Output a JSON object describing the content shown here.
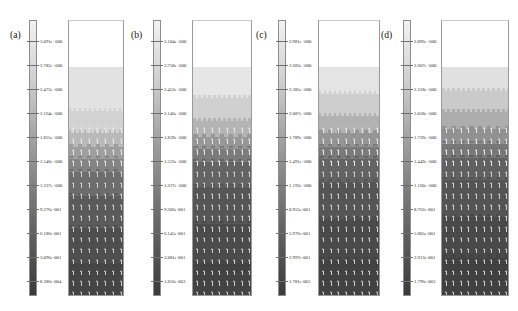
{
  "figure": {
    "type": "contour-vector-plots",
    "panel_count": 4,
    "colorbar_orientation": "vertical",
    "colorbar_colormap": "grayscale",
    "colorbar_top_color": "#f2f2f2",
    "colorbar_bottom_color": "#3a3a3a"
  },
  "chart_data": {
    "type": "heatmap",
    "title": "",
    "xlabel": "",
    "ylabel": "",
    "grid": false,
    "legend_position": "left-of-each-panel",
    "panels": [
      {
        "label": "(a)",
        "colorbar_ticks": [
          "3.091e+000",
          "2.782e+000",
          "2.473e+000",
          "2.164e+000",
          "1.855e+000",
          "1.546e+000",
          "1.237e+000",
          "9.276e-001",
          "6.186e-001",
          "3.096e-001",
          "8.386e-004"
        ],
        "vmax": 3.091,
        "vmin": 0.0008386,
        "surface_fraction": 0.168,
        "bands": [
          {
            "value": 2.78,
            "color": "#e2e2e2",
            "top": 0.0,
            "bottom": 0.19
          },
          {
            "value": 2.47,
            "color": "#d2d2d2",
            "top": 0.19,
            "bottom": 0.285
          },
          {
            "value": 2.16,
            "color": "#b9b9b9",
            "top": 0.285,
            "bottom": 0.345
          },
          {
            "value": 1.86,
            "color": "#9e9e9e",
            "top": 0.345,
            "bottom": 0.4
          },
          {
            "value": 1.55,
            "color": "#848484",
            "top": 0.4,
            "bottom": 0.455
          },
          {
            "value": 1.24,
            "color": "#6d6d6d",
            "top": 0.455,
            "bottom": 0.56
          },
          {
            "value": 0.93,
            "color": "#5b5b5b",
            "top": 0.56,
            "bottom": 0.7
          },
          {
            "value": 0.62,
            "color": "#4e4e4e",
            "top": 0.7,
            "bottom": 0.85
          },
          {
            "value": 0.31,
            "color": "#454545",
            "top": 0.85,
            "bottom": 1.0
          }
        ]
      },
      {
        "label": "(b)",
        "colorbar_ticks": [
          "3.104e+000",
          "2.758e+000",
          "2.452e+000",
          "2.146e+000",
          "1.839e+000",
          "1.533e+000",
          "1.227e+000",
          "9.206e-001",
          "6.145e-001",
          "3.081e-001",
          "1.856e-003"
        ],
        "vmax": 3.104,
        "vmin": 0.001856,
        "surface_fraction": 0.168,
        "bands": [
          {
            "value": 2.76,
            "color": "#e6e6e6",
            "top": 0.0,
            "bottom": 0.135
          },
          {
            "value": 2.45,
            "color": "#d0d0d0",
            "top": 0.135,
            "bottom": 0.235
          },
          {
            "value": 2.15,
            "color": "#b4b4b4",
            "top": 0.235,
            "bottom": 0.305
          },
          {
            "value": 1.84,
            "color": "#979797",
            "top": 0.305,
            "bottom": 0.355
          },
          {
            "value": 1.53,
            "color": "#7b7b7b",
            "top": 0.355,
            "bottom": 0.41
          },
          {
            "value": 1.23,
            "color": "#646464",
            "top": 0.41,
            "bottom": 0.52
          },
          {
            "value": 0.92,
            "color": "#565656",
            "top": 0.52,
            "bottom": 0.68
          },
          {
            "value": 0.61,
            "color": "#4b4b4b",
            "top": 0.68,
            "bottom": 0.85
          },
          {
            "value": 0.31,
            "color": "#434343",
            "top": 0.85,
            "bottom": 1.0
          }
        ]
      },
      {
        "label": "(c)",
        "colorbar_ticks": [
          "2.981e+000",
          "2.683e+000",
          "2.385e+000",
          "2.087e+000",
          "1.789e+000",
          "1.491e+000",
          "1.193e+000",
          "8.955e-001",
          "5.976e-001",
          "2.997e-001",
          "1.781e-003"
        ],
        "vmax": 2.981,
        "vmin": 0.001781,
        "surface_fraction": 0.168,
        "bands": [
          {
            "value": 2.68,
            "color": "#e4e4e4",
            "top": 0.0,
            "bottom": 0.115
          },
          {
            "value": 2.39,
            "color": "#cecece",
            "top": 0.115,
            "bottom": 0.21
          },
          {
            "value": 2.09,
            "color": "#b2b2b2",
            "top": 0.21,
            "bottom": 0.285
          },
          {
            "value": 1.79,
            "color": "#959595",
            "top": 0.285,
            "bottom": 0.345
          },
          {
            "value": 1.49,
            "color": "#7a7a7a",
            "top": 0.345,
            "bottom": 0.4
          },
          {
            "value": 1.19,
            "color": "#636363",
            "top": 0.4,
            "bottom": 0.5
          },
          {
            "value": 0.9,
            "color": "#555555",
            "top": 0.5,
            "bottom": 0.66
          },
          {
            "value": 0.6,
            "color": "#4a4a4a",
            "top": 0.66,
            "bottom": 0.84
          },
          {
            "value": 0.3,
            "color": "#424242",
            "top": 0.84,
            "bottom": 1.0
          }
        ]
      },
      {
        "label": "(d)",
        "colorbar_ticks": [
          "2.896e+000",
          "2.607e+000",
          "2.318e+000",
          "2.028e+000",
          "1.739e+000",
          "1.449e+000",
          "1.160e+000",
          "8.762e-001",
          "5.805e-001",
          "2.913e-001",
          "1.796e-003"
        ],
        "vmax": 2.896,
        "vmin": 0.001796,
        "surface_fraction": 0.168,
        "bands": [
          {
            "value": 2.61,
            "color": "#e0e0e0",
            "top": 0.0,
            "bottom": 0.105
          },
          {
            "value": 2.32,
            "color": "#cacaca",
            "top": 0.105,
            "bottom": 0.195
          },
          {
            "value": 2.03,
            "color": "#adadad",
            "top": 0.195,
            "bottom": 0.27
          },
          {
            "value": 1.74,
            "color": "#919191",
            "top": 0.27,
            "bottom": 0.335
          },
          {
            "value": 1.45,
            "color": "#787878",
            "top": 0.335,
            "bottom": 0.395
          },
          {
            "value": 1.16,
            "color": "#616161",
            "top": 0.395,
            "bottom": 0.49
          },
          {
            "value": 0.88,
            "color": "#545454",
            "top": 0.49,
            "bottom": 0.65
          },
          {
            "value": 0.58,
            "color": "#494949",
            "top": 0.65,
            "bottom": 0.83
          },
          {
            "value": 0.29,
            "color": "#414141",
            "top": 0.83,
            "bottom": 1.0
          }
        ]
      }
    ]
  }
}
